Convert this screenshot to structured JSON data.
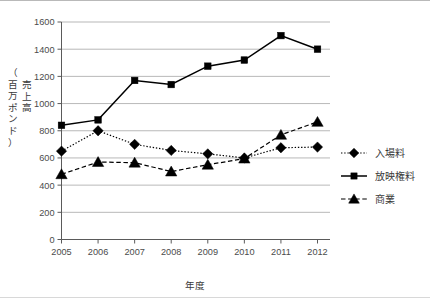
{
  "chart_data": {
    "type": "line",
    "title": "",
    "xlabel": "年度",
    "ylabel": "売上高（百万ポンド）",
    "ylabel_lines": [
      "売上高",
      "（百万ポンド）"
    ],
    "categories": [
      "2005",
      "2006",
      "2007",
      "2008",
      "2009",
      "2010",
      "2011",
      "2012"
    ],
    "x": [
      2005,
      2006,
      2007,
      2008,
      2009,
      2010,
      2011,
      2012
    ],
    "series": [
      {
        "name": "入場料",
        "marker": "diamond",
        "linestyle": "dotted",
        "color": "#000000",
        "values": [
          650,
          800,
          700,
          655,
          630,
          600,
          675,
          680
        ]
      },
      {
        "name": "放映権料",
        "marker": "square",
        "linestyle": "solid",
        "color": "#000000",
        "values": [
          840,
          880,
          1170,
          1140,
          1275,
          1320,
          1500,
          1400
        ]
      },
      {
        "name": "商業",
        "marker": "triangle",
        "linestyle": "dashed",
        "color": "#000000",
        "values": [
          480,
          570,
          565,
          500,
          550,
          595,
          770,
          865
        ]
      }
    ],
    "ylim": [
      0,
      1600
    ],
    "yticks": [
      0,
      200,
      400,
      600,
      800,
      1000,
      1200,
      1400,
      1600
    ],
    "ytick_labels": [
      "0",
      "200",
      "400",
      "600",
      "800",
      "1000",
      "1200",
      "1400",
      "1600"
    ],
    "xlim": [
      2005,
      2012
    ],
    "grid": "horizontal",
    "legend_position": "right"
  },
  "legend": {
    "items": [
      {
        "label": "入場料",
        "marker": "diamond",
        "linestyle": "dotted"
      },
      {
        "label": "放映権料",
        "marker": "square",
        "linestyle": "solid"
      },
      {
        "label": "商業",
        "marker": "triangle",
        "linestyle": "dashed"
      }
    ]
  }
}
